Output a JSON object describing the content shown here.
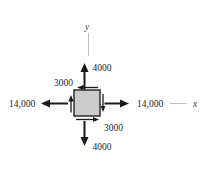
{
  "figure": {
    "axes": {
      "x_label": "x",
      "y_label": "y"
    },
    "labels": {
      "sigma_x_left": "14,000",
      "sigma_x_right": "14,000",
      "sigma_y_top": "4000",
      "sigma_y_bottom": "4000",
      "shear_top": "3000",
      "shear_bottom": "3000"
    },
    "arrow_directions": {
      "sigma_x": "outward (tension, left and right)",
      "sigma_y": "outward (tension, up and down)",
      "shear": "top face left, bottom face right, left face up, right face down"
    },
    "colors": {
      "background": "#ffffff",
      "arrow": "#1a1a1a",
      "element_fill": "#cbcbcb",
      "element_border": "#2e2e2e",
      "axis_line": "#b8b8b8",
      "text": "#262626"
    }
  }
}
